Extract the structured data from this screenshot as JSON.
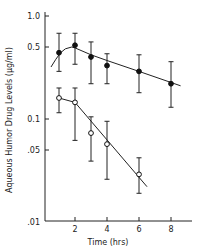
{
  "chart_data": {
    "type": "scatter",
    "title": "",
    "xlabel": "Time (hrs)",
    "ylabel": "Aqueous Humor Drug Levels (µg/ml)",
    "yscale": "log",
    "xlim": [
      0,
      9.3
    ],
    "ylim": [
      0.01,
      1.2
    ],
    "grid": false,
    "legend": null,
    "x_ticks": [
      2,
      4,
      6,
      8
    ],
    "x_tick_labels": [
      "2",
      "4",
      "6",
      "8"
    ],
    "y_ticks": [
      1.0,
      0.5,
      0.1,
      0.05,
      0.01
    ],
    "y_tick_labels": [
      "1.0",
      "0.5",
      "0.1",
      ".05",
      ".01"
    ],
    "series": [
      {
        "name": "filled circles",
        "marker": "filled-circle",
        "x": [
          1,
          2,
          3,
          4,
          6,
          8
        ],
        "values": [
          0.44,
          0.52,
          0.4,
          0.33,
          0.29,
          0.22
        ],
        "err_upper": [
          0.68,
          0.68,
          0.56,
          0.43,
          0.42,
          0.36
        ],
        "err_lower": [
          0.29,
          0.34,
          0.22,
          0.22,
          0.18,
          0.13
        ],
        "fit_curve": {
          "x": [
            0.5,
            0.8,
            1.1,
            1.4,
            1.8,
            2.0,
            3,
            4,
            6,
            8.6
          ],
          "values": [
            0.32,
            0.38,
            0.44,
            0.48,
            0.5,
            0.49,
            0.42,
            0.37,
            0.29,
            0.21
          ]
        }
      },
      {
        "name": "open circles",
        "marker": "open-circle",
        "x": [
          1,
          2,
          3,
          4,
          6
        ],
        "values": [
          0.16,
          0.145,
          0.073,
          0.057,
          0.029
        ],
        "err_upper": [
          0.2,
          0.2,
          0.105,
          0.095,
          0.042
        ],
        "err_lower": [
          0.115,
          0.062,
          0.039,
          0.026,
          0.019
        ],
        "fit_curve": {
          "x": [
            1,
            2,
            6.5
          ],
          "values": [
            0.16,
            0.145,
            0.022
          ]
        }
      }
    ]
  }
}
